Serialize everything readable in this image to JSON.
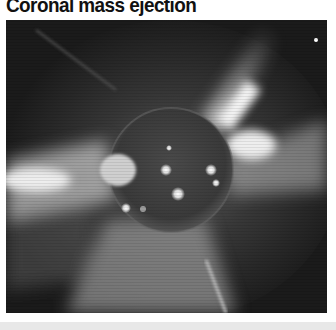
{
  "figure": {
    "title": "Coronal mass ejection",
    "image": {
      "subject": "sun-corona-cme-photo",
      "description": "Grayscale solar image: dark sun disk with bright active regions, radiating coronal streamers and a large ejection plume extending toward the lower left"
    }
  },
  "colors": {
    "background": "#ffffff",
    "photo_dark": "#1a1a1a",
    "bottom_band": "#e8e8e8"
  }
}
